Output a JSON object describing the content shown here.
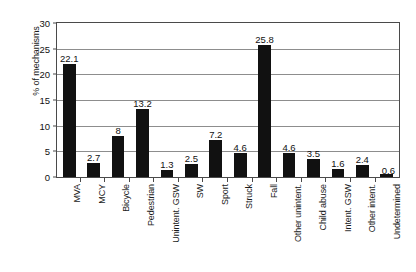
{
  "chart_data": {
    "type": "bar",
    "title": "",
    "subtitle": "",
    "xlabel": "",
    "ylabel": "% of mechanisms",
    "ylim": [
      0,
      30
    ],
    "ytick_values": [
      0,
      5,
      10,
      15,
      20,
      25,
      30
    ],
    "ytick_labels": [
      "0",
      "5",
      "10",
      "15",
      "20",
      "25",
      "30"
    ],
    "grid": "horizontal",
    "legend": "none",
    "bar_color": "#111111",
    "categories": [
      "MVA",
      "MCY",
      "Bicycle",
      "Pedestrian",
      "Unintent. GSW",
      "SW",
      "Sport",
      "Struck",
      "Fall",
      "Other unintent.",
      "Child abuse",
      "Intent. GSW",
      "Other intent.",
      "Undetermined"
    ],
    "values": [
      22.1,
      2.7,
      8,
      13.2,
      1.3,
      2.5,
      7.2,
      4.6,
      25.8,
      4.6,
      3.5,
      1.6,
      2.4,
      0.6
    ],
    "value_labels": [
      "22.1",
      "2.7",
      "8",
      "13.2",
      "1.3",
      "2.5",
      "7.2",
      "4.6",
      "25.8",
      "4.6",
      "3.5",
      "1.6",
      "2.4",
      "0.6"
    ],
    "label_placement": [
      "top",
      "top",
      "top",
      "top",
      "top",
      "top",
      "top",
      "top",
      "top",
      "top",
      "top",
      "top",
      "top",
      "side"
    ]
  }
}
